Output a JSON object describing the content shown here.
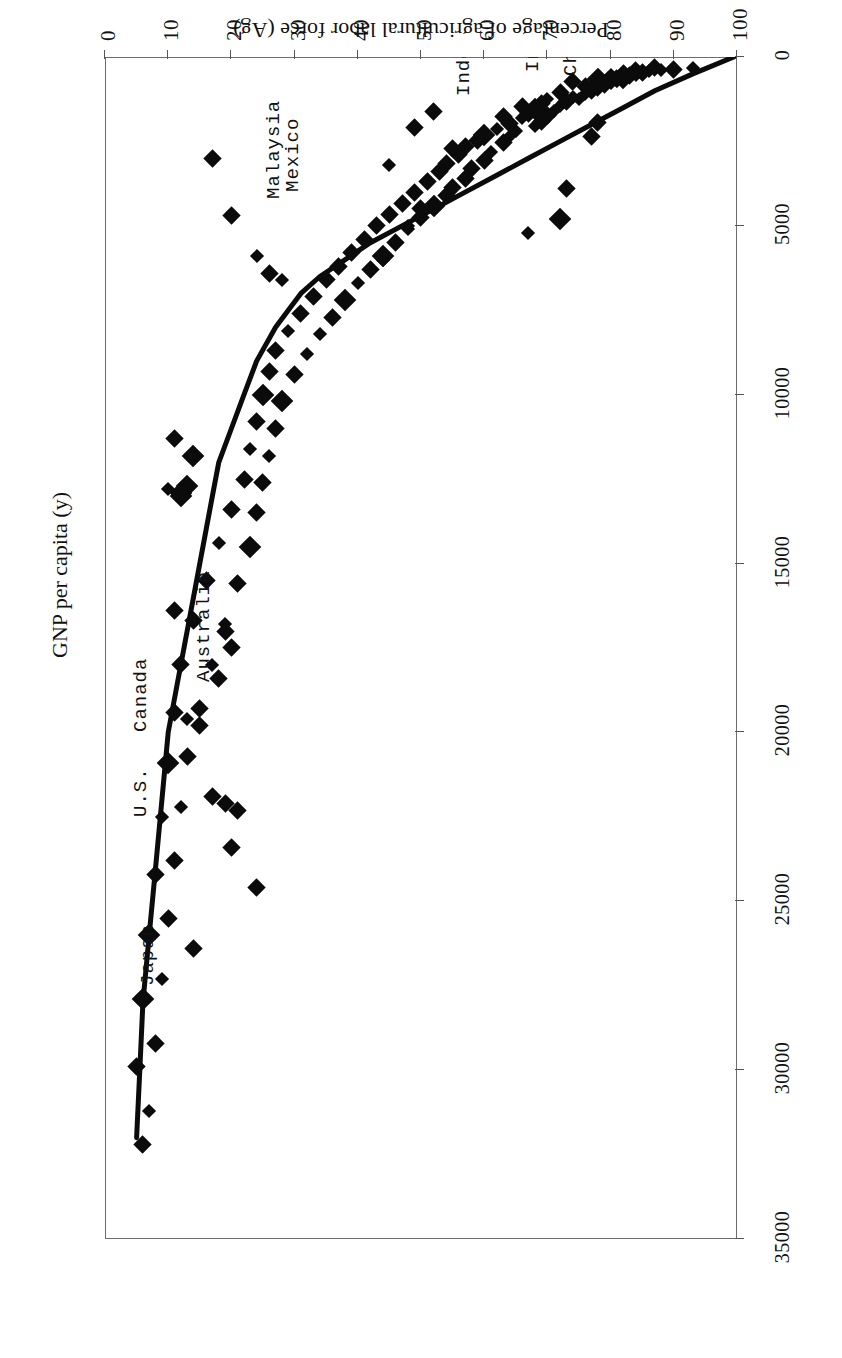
{
  "chart_data": {
    "type": "scatter",
    "title": "",
    "orientation": "page-rotated-180",
    "xlabel": "GNP per capita (y)",
    "ylabel": "Percentage of agricultural labor force (Ag)",
    "xlim": [
      0,
      35000
    ],
    "ylim": [
      0,
      100
    ],
    "xticks": [
      0,
      5000,
      10000,
      15000,
      20000,
      25000,
      30000,
      35000
    ],
    "xticklabels": [
      "0",
      "5000",
      "10000",
      "15000",
      "20000",
      "25000",
      "30000",
      "35000"
    ],
    "yticks": [
      0,
      10,
      20,
      30,
      40,
      50,
      60,
      70,
      80,
      90,
      100
    ],
    "yticklabels": [
      "0",
      "10",
      "20",
      "30",
      "40",
      "50",
      "60",
      "70",
      "80",
      "90",
      "100"
    ],
    "grid": false,
    "legend": "none",
    "marker": "diamond",
    "marker_color": "#0b0b0b",
    "series": [
      {
        "name": "Countries",
        "points": [
          [
            320,
            93
          ],
          [
            360,
            90
          ],
          [
            380,
            88
          ],
          [
            300,
            87
          ],
          [
            420,
            86
          ],
          [
            450,
            85
          ],
          [
            400,
            84
          ],
          [
            520,
            84
          ],
          [
            560,
            83
          ],
          [
            480,
            82
          ],
          [
            610,
            82
          ],
          [
            640,
            81
          ],
          [
            700,
            81
          ],
          [
            540,
            80
          ],
          [
            760,
            80
          ],
          [
            820,
            79
          ],
          [
            660,
            78
          ],
          [
            900,
            78
          ],
          [
            980,
            77
          ],
          [
            860,
            76
          ],
          [
            1100,
            76
          ],
          [
            1250,
            75
          ],
          [
            720,
            74
          ],
          [
            1180,
            74
          ],
          [
            1320,
            73
          ],
          [
            1050,
            72
          ],
          [
            1450,
            72
          ],
          [
            1600,
            71
          ],
          [
            1240,
            70
          ],
          [
            1720,
            70
          ],
          [
            1380,
            69
          ],
          [
            1900,
            69
          ],
          [
            1540,
            68
          ],
          [
            2050,
            68
          ],
          [
            1660,
            67
          ],
          [
            1480,
            66
          ],
          [
            1820,
            66
          ],
          [
            2200,
            65
          ],
          [
            1980,
            64
          ],
          [
            2380,
            64
          ],
          [
            1760,
            63
          ],
          [
            2540,
            63
          ],
          [
            2120,
            62
          ],
          [
            2800,
            61
          ],
          [
            2300,
            60
          ],
          [
            3050,
            60
          ],
          [
            2460,
            59
          ],
          [
            3300,
            58
          ],
          [
            2650,
            57
          ],
          [
            3600,
            57
          ],
          [
            2900,
            56
          ],
          [
            3850,
            55
          ],
          [
            3150,
            54
          ],
          [
            4100,
            54
          ],
          [
            3400,
            53
          ],
          [
            4400,
            52
          ],
          [
            3700,
            51
          ],
          [
            4750,
            50
          ],
          [
            4000,
            49
          ],
          [
            5100,
            48
          ],
          [
            4350,
            47
          ],
          [
            5500,
            46
          ],
          [
            4650,
            45
          ],
          [
            5900,
            44
          ],
          [
            5000,
            43
          ],
          [
            6300,
            42
          ],
          [
            5400,
            41
          ],
          [
            6700,
            40
          ],
          [
            5800,
            39
          ],
          [
            7200,
            38
          ],
          [
            6200,
            37
          ],
          [
            7700,
            36
          ],
          [
            6600,
            35
          ],
          [
            8200,
            34
          ],
          [
            7100,
            33
          ],
          [
            8800,
            32
          ],
          [
            7600,
            31
          ],
          [
            9400,
            30
          ],
          [
            8100,
            29
          ],
          [
            10200,
            28
          ],
          [
            8700,
            27
          ],
          [
            11000,
            27
          ],
          [
            9300,
            26
          ],
          [
            11800,
            26
          ],
          [
            10000,
            25
          ],
          [
            12600,
            25
          ],
          [
            10800,
            24
          ],
          [
            13500,
            24
          ],
          [
            11600,
            23
          ],
          [
            14500,
            23
          ],
          [
            12500,
            22
          ],
          [
            15600,
            21
          ],
          [
            13400,
            20
          ],
          [
            16800,
            19
          ],
          [
            14400,
            18
          ],
          [
            18000,
            17
          ],
          [
            15500,
            16
          ],
          [
            19300,
            15
          ],
          [
            16700,
            14
          ],
          [
            20700,
            13
          ],
          [
            18000,
            12
          ],
          [
            22200,
            12
          ],
          [
            19400,
            11
          ],
          [
            23800,
            11
          ],
          [
            20900,
            10
          ],
          [
            25500,
            10
          ],
          [
            22500,
            9
          ],
          [
            27300,
            9
          ],
          [
            24200,
            8
          ],
          [
            29200,
            8
          ],
          [
            26000,
            7
          ],
          [
            31200,
            7
          ],
          [
            27900,
            6
          ],
          [
            32200,
            6
          ],
          [
            29900,
            5
          ],
          [
            1950,
            78
          ],
          [
            2350,
            77
          ],
          [
            3900,
            73
          ],
          [
            4800,
            72
          ],
          [
            5200,
            67
          ],
          [
            2700,
            55
          ],
          [
            4500,
            50
          ],
          [
            5000,
            48
          ],
          [
            3200,
            45
          ],
          [
            6000,
            44
          ],
          [
            1600,
            52
          ],
          [
            2100,
            49
          ],
          [
            6600,
            28
          ],
          [
            6400,
            26
          ],
          [
            5900,
            24
          ],
          [
            11800,
            14
          ],
          [
            12700,
            13
          ],
          [
            12900,
            12
          ],
          [
            13000,
            12
          ],
          [
            11300,
            11
          ],
          [
            17000,
            19
          ],
          [
            17500,
            20
          ],
          [
            18400,
            18
          ],
          [
            22300,
            21
          ],
          [
            23400,
            20
          ],
          [
            24600,
            24
          ],
          [
            19800,
            15
          ],
          [
            19600,
            13
          ],
          [
            21900,
            17
          ],
          [
            22100,
            19
          ],
          [
            26400,
            14
          ],
          [
            16400,
            11
          ],
          [
            12800,
            10
          ],
          [
            4700,
            20
          ],
          [
            3000,
            17
          ]
        ]
      }
    ],
    "fit_curve": {
      "description": "fitted exponential-decay trend line through the scatter",
      "points": [
        [
          0,
          99.5
        ],
        [
          500,
          93
        ],
        [
          1000,
          87
        ],
        [
          1500,
          82
        ],
        [
          2000,
          77
        ],
        [
          2500,
          72
        ],
        [
          3000,
          67
        ],
        [
          3500,
          62
        ],
        [
          4000,
          57
        ],
        [
          4500,
          52
        ],
        [
          5000,
          47
        ],
        [
          5500,
          42
        ],
        [
          6000,
          38
        ],
        [
          6500,
          34
        ],
        [
          7000,
          31
        ],
        [
          7500,
          29
        ],
        [
          8000,
          27
        ],
        [
          9000,
          24
        ],
        [
          10000,
          22
        ],
        [
          11000,
          20
        ],
        [
          12000,
          18
        ],
        [
          13000,
          17
        ],
        [
          14000,
          16
        ],
        [
          16000,
          14
        ],
        [
          18000,
          12
        ],
        [
          20000,
          10
        ],
        [
          22000,
          9
        ],
        [
          24000,
          8
        ],
        [
          26000,
          7
        ],
        [
          28000,
          6
        ],
        [
          30000,
          5.5
        ],
        [
          32000,
          5
        ]
      ],
      "color": "#0b0b0b",
      "width": 5
    },
    "annotations": [
      {
        "label": "China",
        "x": 550,
        "y": 72
      },
      {
        "label": "India",
        "x": 440,
        "y": 66
      },
      {
        "label": "Indonesia",
        "x": 1150,
        "y": 55
      },
      {
        "label": "Mexico",
        "x": 4000,
        "y": 28
      },
      {
        "label": "Malaysia",
        "x": 4200,
        "y": 25
      },
      {
        "label": "Australia",
        "x": 18500,
        "y": 14
      },
      {
        "label": "Canada",
        "x": 20000,
        "y": 4
      },
      {
        "label": "U.S.",
        "x": 22500,
        "y": 4
      },
      {
        "label": "Japan",
        "x": 27500,
        "y": 5
      }
    ]
  }
}
